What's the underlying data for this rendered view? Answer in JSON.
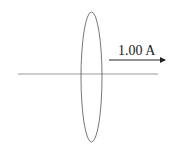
{
  "diagram": {
    "current_label": "1.00 A",
    "colors": {
      "wire": "#9a9a9a",
      "loop": "#555555",
      "arrow": "#222222",
      "text": "#222222",
      "background": "#ffffff"
    },
    "elements": [
      {
        "type": "line",
        "name": "wire",
        "from": [
          18,
          74
        ],
        "to": [
          158,
          74
        ]
      },
      {
        "type": "ellipse",
        "name": "loop",
        "cx": 91.5,
        "cy": 77,
        "rx": 10.5,
        "ry": 65
      },
      {
        "type": "arrow",
        "name": "current-direction",
        "from": [
          109,
          60
        ],
        "to": [
          166,
          60
        ]
      },
      {
        "type": "text",
        "name": "current-label",
        "value": "1.00 A",
        "x": 118,
        "y": 55
      }
    ]
  }
}
